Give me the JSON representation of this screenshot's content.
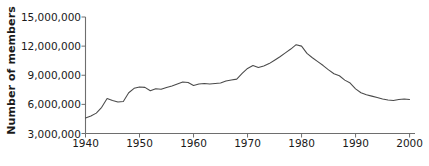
{
  "chart_data": {
    "type": "line",
    "title": "",
    "xlabel": "",
    "ylabel": "Number of members",
    "xlim": [
      1940,
      2001
    ],
    "ylim": [
      3000000,
      15000000
    ],
    "grid": false,
    "legend": null,
    "x_ticks": [
      "1940",
      "1950",
      "1960",
      "1970",
      "1980",
      "1990",
      "2000"
    ],
    "x_tick_values": [
      1940,
      1950,
      1960,
      1970,
      1980,
      1990,
      2000
    ],
    "y_ticks": [
      "3,000,000",
      "6,000,000",
      "9,000,000",
      "12,000,000",
      "15,000,000"
    ],
    "y_tick_values": [
      3000000,
      6000000,
      9000000,
      12000000,
      15000000
    ],
    "series": [
      {
        "name": "Number of members",
        "color": "#4a4a4a",
        "x": [
          1940,
          1941,
          1942,
          1943,
          1944,
          1945,
          1946,
          1947,
          1948,
          1949,
          1950,
          1951,
          1952,
          1953,
          1954,
          1955,
          1956,
          1957,
          1958,
          1959,
          1960,
          1961,
          1962,
          1963,
          1964,
          1965,
          1966,
          1967,
          1968,
          1969,
          1970,
          1971,
          1972,
          1973,
          1974,
          1975,
          1976,
          1977,
          1978,
          1979,
          1980,
          1981,
          1982,
          1983,
          1984,
          1985,
          1986,
          1987,
          1988,
          1989,
          1990,
          1991,
          1992,
          1993,
          1994,
          1995,
          1996,
          1997,
          1998,
          1999,
          2000
        ],
        "y": [
          4600000,
          4800000,
          5100000,
          5700000,
          6600000,
          6400000,
          6250000,
          6300000,
          7200000,
          7650000,
          7800000,
          7750000,
          7400000,
          7600000,
          7550000,
          7750000,
          7900000,
          8100000,
          8300000,
          8250000,
          7950000,
          8100000,
          8150000,
          8100000,
          8150000,
          8200000,
          8400000,
          8500000,
          8600000,
          9200000,
          9700000,
          10000000,
          9800000,
          9950000,
          10200000,
          10550000,
          10900000,
          11300000,
          11700000,
          12150000,
          12000000,
          11250000,
          10800000,
          10400000,
          10000000,
          9550000,
          9150000,
          8950000,
          8500000,
          8200000,
          7600000,
          7200000,
          7000000,
          6850000,
          6700000,
          6550000,
          6450000,
          6400000,
          6500000,
          6550000,
          6500000
        ]
      }
    ]
  },
  "axis": {
    "y_axis_name": "y-axis",
    "x_axis_name": "x-axis"
  }
}
